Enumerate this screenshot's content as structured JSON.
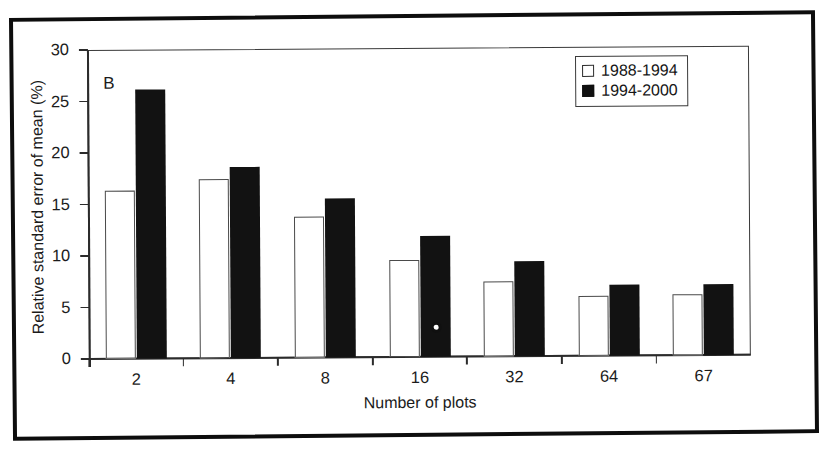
{
  "figure": {
    "panel_label": "B",
    "background_color": "#ffffff",
    "axis_color": "#2b2b2b"
  },
  "legend": {
    "position": "top-right",
    "entries": [
      {
        "label": "1988-1994",
        "marker": "open-square",
        "color": "#ffffff"
      },
      {
        "label": "1994-2000",
        "marker": "filled-square",
        "color": "#101010"
      }
    ]
  },
  "chart_data": {
    "type": "bar",
    "title": "",
    "subtitle": "",
    "xlabel": "Number of plots",
    "ylabel": "Relative standard error of mean (%)",
    "categories": [
      "2",
      "4",
      "8",
      "16",
      "32",
      "64",
      "67"
    ],
    "series": [
      {
        "name": "1988-1994",
        "color": "#ffffff",
        "values": [
          16.3,
          17.4,
          13.7,
          9.4,
          7.3,
          5.8,
          5.9
        ]
      },
      {
        "name": "1994-2000",
        "color": "#101010",
        "values": [
          26.1,
          18.5,
          15.4,
          11.7,
          9.2,
          6.9,
          6.9
        ]
      }
    ],
    "ylim": [
      0,
      30
    ],
    "yticks": [
      0,
      5,
      10,
      15,
      20,
      25,
      30
    ],
    "ytick_labels": [
      "0",
      "5",
      "10",
      "15",
      "20",
      "25",
      "30"
    ],
    "grid": false,
    "legend_position": "top-right",
    "annotations": [
      {
        "text": "B",
        "kind": "panel-label"
      }
    ]
  }
}
